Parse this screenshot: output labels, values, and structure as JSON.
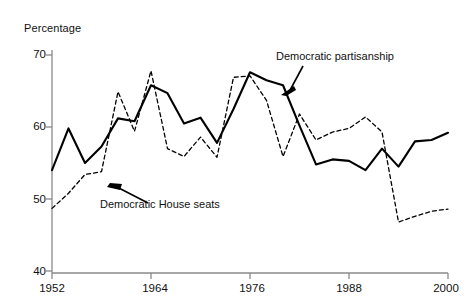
{
  "figure": {
    "y_axis_title": "Percentage",
    "y_ticks": [
      40,
      50,
      60,
      70
    ],
    "x_ticks": [
      1952,
      1964,
      1976,
      1988,
      2000
    ],
    "annotations": [
      {
        "name": "democratic-partisanship",
        "text": "Democratic partisanship"
      },
      {
        "name": "democratic-house-seats",
        "text": "Democratic House seats"
      }
    ]
  },
  "chart_data": {
    "type": "line",
    "title": "",
    "xlabel": "",
    "ylabel": "Percentage",
    "xlim": [
      1952,
      2000
    ],
    "ylim": [
      40,
      70
    ],
    "grid": false,
    "legend": "annotated-inline",
    "x": [
      1952,
      1954,
      1956,
      1958,
      1960,
      1962,
      1964,
      1966,
      1968,
      1970,
      1972,
      1974,
      1976,
      1978,
      1980,
      1982,
      1984,
      1986,
      1988,
      1990,
      1992,
      1994,
      1996,
      1998,
      2000
    ],
    "series": [
      {
        "name": "Democratic partisanship",
        "style": "solid",
        "color": "#000000",
        "values": [
          54.0,
          59.8,
          55.0,
          57.3,
          61.2,
          60.8,
          65.8,
          64.7,
          60.5,
          61.3,
          57.8,
          62.5,
          67.6,
          66.5,
          65.8,
          60.2,
          54.8,
          55.5,
          55.3,
          54.0,
          57.0,
          54.5,
          58.0,
          58.2,
          59.2
        ]
      },
      {
        "name": "Democratic House seats",
        "style": "dashed",
        "color": "#000000",
        "values": [
          48.7,
          50.8,
          53.4,
          53.8,
          64.9,
          59.4,
          67.8,
          57.0,
          55.9,
          58.6,
          55.8,
          66.9,
          67.1,
          63.7,
          55.9,
          61.8,
          58.2,
          59.3,
          59.8,
          61.4,
          59.3,
          46.8,
          47.6,
          48.3,
          48.6
        ]
      }
    ]
  }
}
